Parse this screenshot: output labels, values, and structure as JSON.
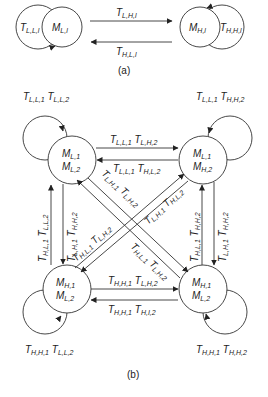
{
  "panel_a": {
    "caption": "(a)",
    "nodes": {
      "left": {
        "var": "M",
        "sub": "L,l"
      },
      "right": {
        "var": "M",
        "sub": "H,l"
      }
    },
    "self_loops": {
      "left": {
        "var": "T",
        "sub": "L,L,l"
      },
      "right": {
        "var": "T",
        "sub": "H,H,l"
      }
    },
    "edges": {
      "left_to_right": {
        "var": "T",
        "sub": "L,H,l"
      },
      "right_to_left": {
        "var": "T",
        "sub": "H,L,l"
      }
    }
  },
  "panel_b": {
    "caption": "(b)",
    "nodes": {
      "top_left": {
        "line1_sub": "L,1",
        "line2_sub": "L,2"
      },
      "top_right": {
        "line1_sub": "L,1",
        "line2_sub": "H,2"
      },
      "bottom_left": {
        "line1_sub": "H,1",
        "line2_sub": "L,2"
      },
      "bottom_right": {
        "line1_sub": "H,1",
        "line2_sub": "L,2"
      }
    },
    "node_var": "M",
    "trans_var": "T",
    "self_loops": {
      "top_left": {
        "a": "L,L,1",
        "b": "L,L,2"
      },
      "top_right": {
        "a": "L,L,1",
        "b": "H,H,2"
      },
      "bottom_left": {
        "a": "H,H,1",
        "b": "L,L,2"
      },
      "bottom_right": {
        "a": "H,H,1",
        "b": "H,H,2"
      }
    },
    "edges": {
      "tl_to_tr": {
        "a": "L,L,1",
        "b": "L,H,2"
      },
      "tr_to_tl": {
        "a": "L,L,1",
        "b": "H,L,2"
      },
      "bl_to_br": {
        "a": "H,H,1",
        "b": "L,H,2"
      },
      "br_to_bl": {
        "a": "H,H,1",
        "b": "H,I,2"
      },
      "bl_to_tl": {
        "a": "H,L,1",
        "b": "L,L,2"
      },
      "tl_to_bl": {
        "a": "L,H,1",
        "b": "H,H,2"
      },
      "br_to_tr": {
        "a": "H,L,1",
        "b": "H,H,2"
      },
      "tr_to_br": {
        "a": "L,H,1",
        "b": "H,H,2"
      },
      "tl_to_br": {
        "a": "L,H,1",
        "b": "L,H,2"
      },
      "br_to_tl": {
        "a": "H,L,1",
        "b": "L,H,2"
      },
      "bl_to_tr": {
        "a": "L,H,1",
        "b": "H,L,2"
      },
      "tr_to_bl": {
        "a": "H,L,1",
        "b": "L,H,2"
      }
    }
  }
}
